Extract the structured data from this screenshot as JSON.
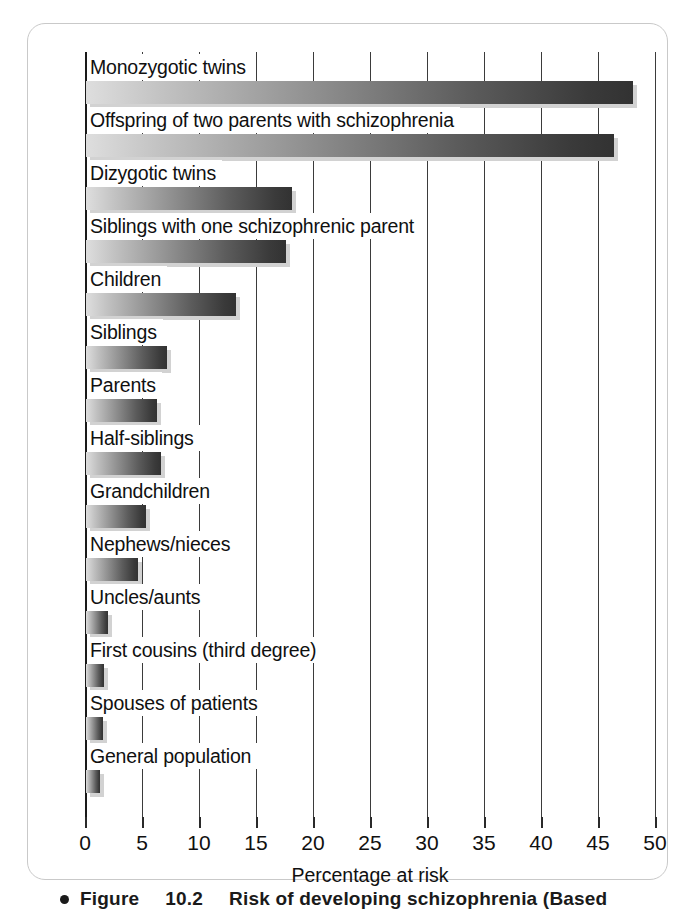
{
  "figure": {
    "caption_bullet": "bullet-dot",
    "caption_label": "Figure",
    "caption_number": "10.2",
    "caption_text": "Risk of developing schizophrenia (Based"
  },
  "chart_data": {
    "type": "bar",
    "orientation": "horizontal",
    "title": "",
    "xlabel": "Percentage at risk",
    "ylabel": "",
    "xlim": [
      0,
      50
    ],
    "xticks": [
      0,
      5,
      10,
      15,
      20,
      25,
      30,
      35,
      40,
      45,
      50
    ],
    "xtick_labels": [
      "0",
      "5",
      "10",
      "15",
      "20",
      "25",
      "30",
      "35",
      "40",
      "45",
      "50"
    ],
    "grid": "vertical",
    "legend": "none",
    "bar_fill": "gradient-light-to-dark-gray",
    "bar_color_start": "#dedede",
    "bar_color_end": "#323232",
    "categories": [
      "Monozygotic twins",
      "Offspring of two parents with schizophrenia",
      "Dizygotic twins",
      "Siblings with one schizophrenic parent",
      "Children",
      "Siblings",
      "Parents",
      "Half-siblings",
      "Grandchildren",
      "Nephews/nieces",
      "Uncles/aunts",
      "First cousins (third degree)",
      "Spouses of patients",
      "General population"
    ],
    "values": [
      48,
      46.3,
      18.1,
      17.5,
      13.2,
      7.1,
      6.2,
      6.6,
      5.3,
      4.6,
      1.9,
      1.6,
      1.5,
      1.2
    ]
  }
}
